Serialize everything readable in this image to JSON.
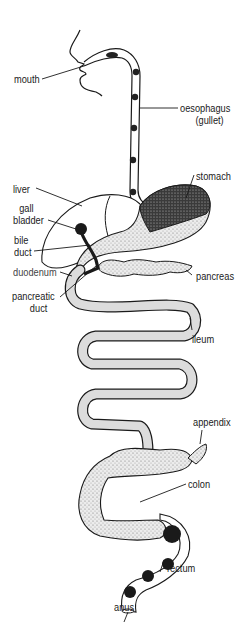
{
  "diagram": {
    "labels": {
      "mouth": "mouth",
      "oesophagus_line1": "oesophagus",
      "oesophagus_line2": "(gullet)",
      "liver": "liver",
      "gall_bladder_line1": "gall",
      "gall_bladder_line2": "bladder",
      "stomach": "stomach",
      "bile_duct_line1": "bile",
      "bile_duct_line2": "duct",
      "duodenum": "duodenum",
      "pancreas": "pancreas",
      "pancreatic_duct_line1": "pancreatic",
      "pancreatic_duct_line2": "duct",
      "ileum": "ileum",
      "appendix": "appendix",
      "colon": "colon",
      "rectum": "rectum",
      "anus": "anus"
    },
    "colors": {
      "ink": "#1a1a1a",
      "stipple_fill": "#d9d9d9",
      "dark_fill": "#222222",
      "background": "#ffffff"
    }
  }
}
